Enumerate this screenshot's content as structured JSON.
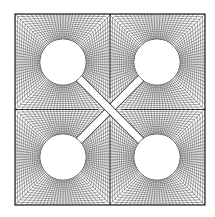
{
  "diagram": {
    "title": "Structured mesh around four circular holes connected by diagonal slits",
    "domain": {
      "x0": 15,
      "y0": 14,
      "x1": 205,
      "y1": 205
    },
    "line_color": "#3a3a3a",
    "border_color": "#1e1e1e",
    "background": "#ffffff",
    "radial_lines_per_hole": 96,
    "rings_per_hole": 14,
    "holes": [
      {
        "name": "hole-top-left",
        "cx": 63,
        "cy": 62,
        "r": 23
      },
      {
        "name": "hole-top-right",
        "cx": 157,
        "cy": 62,
        "r": 23
      },
      {
        "name": "hole-bottom-left",
        "cx": 63,
        "cy": 157,
        "r": 23
      },
      {
        "name": "hole-bottom-right",
        "cx": 157,
        "cy": 157,
        "r": 23
      }
    ],
    "slit_width": 7
  }
}
